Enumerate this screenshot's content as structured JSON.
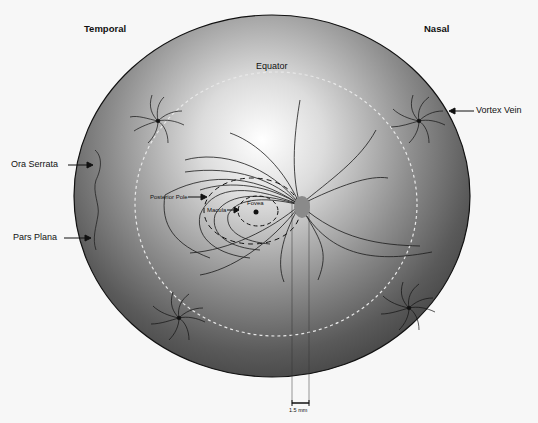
{
  "diagram": {
    "orientation": {
      "left": "Temporal",
      "right": "Nasal"
    },
    "labels": {
      "equator": "Equator",
      "vortex_vein": "Vortex Vein",
      "ora_serrata": "Ora Serrata",
      "pars_plana": "Pars Plana",
      "posterior_pole": "Posterior Pole",
      "macula": "Macula",
      "fovea": "Fovea"
    },
    "scale_bar": {
      "label": "1.5 mm"
    },
    "colors": {
      "globe_dark": "#4a4a4a",
      "globe_light": "#f2f2f2",
      "optic_disc": "#8a8a8a",
      "equator_dash": "#e6e6e6",
      "lines": "#1a1a1a"
    }
  }
}
